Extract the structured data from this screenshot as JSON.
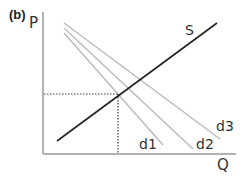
{
  "figure": {
    "panel_label": "(b)",
    "y_axis_label": "P",
    "x_axis_label": "Q"
  },
  "curves": {
    "supply": {
      "label": "S",
      "color": "#222222",
      "from": [
        57,
        141
      ],
      "to": [
        217,
        23
      ]
    },
    "demand": [
      {
        "label": "d1",
        "color": "#bbbbbb",
        "from": [
          64,
          33
        ],
        "to": [
          163,
          145
        ]
      },
      {
        "label": "d2",
        "color": "#bbbbbb",
        "from": [
          64,
          28
        ],
        "to": [
          193,
          149
        ]
      },
      {
        "label": "d3",
        "color": "#bbbbbb",
        "from": [
          64,
          23
        ],
        "to": [
          220,
          139
        ]
      }
    ]
  },
  "equilibrium": {
    "x": 118,
    "y": 94,
    "guide_style": "dotted",
    "guide_color": "#444444"
  },
  "axes": {
    "origin": [
      43,
      154
    ],
    "y_top": 12,
    "x_right": 236,
    "color": "#999999"
  }
}
